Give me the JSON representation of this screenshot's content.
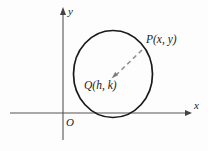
{
  "figure": {
    "type": "coordinate-geometry-diagram",
    "background_color": "#fdfdfd",
    "stroke_color": "#1a1a1a",
    "axis_color": "#555555",
    "dash_color": "#8a8a8a"
  },
  "axes": {
    "x_axis": {
      "label": "x",
      "start": [
        10,
        113
      ],
      "end": [
        192,
        113
      ],
      "has_arrow": true
    },
    "y_axis": {
      "label": "y",
      "start": [
        63,
        140
      ],
      "end": [
        63,
        8
      ],
      "has_arrow": true
    },
    "origin": {
      "label": "O",
      "position": [
        63,
        113
      ]
    }
  },
  "circle": {
    "center": [
      113,
      74
    ],
    "radius_x": 39.5,
    "radius_y": 43.5,
    "stroke_width": 1.6
  },
  "points": [
    {
      "name": "center-point",
      "label": "Q(h, k)",
      "position": [
        112,
        78
      ]
    },
    {
      "name": "circle-point",
      "label": "P(x, y)",
      "position": [
        143,
        49
      ]
    }
  ],
  "radius_segment": {
    "name": "radius",
    "from": [
      143,
      49
    ],
    "to": [
      112,
      78
    ],
    "style": "dashed",
    "arrow_at": "center"
  }
}
